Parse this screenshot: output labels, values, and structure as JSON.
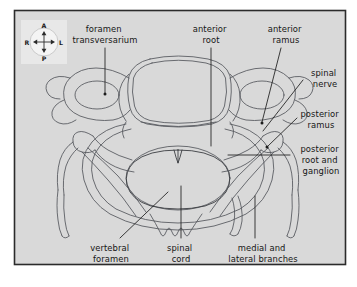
{
  "figure": {
    "panel": {
      "background_color": "#d9d9d9",
      "border_color": "#2b2b2b",
      "page_background": "#ffffff"
    },
    "ink": {
      "anatomy_stroke": "#54565c",
      "leader_line": "#1c1c1c",
      "text_color": "#151515"
    }
  },
  "compass": {
    "name": "orientation-key",
    "background_color": "#e8e8e8",
    "disc_color": "#f2f2f2",
    "anterior": "A",
    "posterior": "P",
    "right": "R",
    "left": "L"
  },
  "labels": [
    {
      "id": "foramen-transversarium",
      "lines": [
        "foramen",
        "transversarium"
      ],
      "x": 105,
      "y": 34,
      "position": "top-left"
    },
    {
      "id": "anterior-root",
      "lines": [
        "anterior",
        "root"
      ],
      "x": 211,
      "y": 34,
      "position": "top-center"
    },
    {
      "id": "anterior-ramus",
      "lines": [
        "anterior",
        "ramus"
      ],
      "x": 286,
      "y": 34,
      "position": "top-right"
    },
    {
      "id": "spinal-nerve",
      "lines": [
        "spinal",
        "nerve"
      ],
      "x": 325,
      "y": 76,
      "position": "right-upper"
    },
    {
      "id": "posterior-ramus",
      "lines": [
        "posterior",
        "ramus"
      ],
      "x": 321,
      "y": 117,
      "position": "right-middle"
    },
    {
      "id": "posterior-root-and-ganglion",
      "lines": [
        "posterior",
        "root and",
        "ganglion"
      ],
      "x": 321,
      "y": 152,
      "position": "right-lower"
    },
    {
      "id": "vertebral-foramen",
      "lines": [
        "vertebral",
        "foramen"
      ],
      "x": 111,
      "y": 251,
      "position": "bottom-left"
    },
    {
      "id": "spinal-cord",
      "lines": [
        "spinal",
        "cord"
      ],
      "x": 181,
      "y": 251,
      "position": "bottom-center"
    },
    {
      "id": "medial-and-lateral-branches",
      "lines": [
        "medial and",
        "lateral branches"
      ],
      "x": 263,
      "y": 251,
      "position": "bottom-right"
    }
  ]
}
